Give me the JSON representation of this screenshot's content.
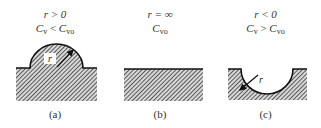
{
  "figure": {
    "panels": [
      {
        "id": "a",
        "condition": "r > 0",
        "relation": {
          "left_base": "C",
          "left_sub": "v",
          "op": " < ",
          "right_base": "C",
          "right_sub": "vo"
        },
        "caption": "(a)",
        "shape": "convex-bump",
        "radius_label": "r"
      },
      {
        "id": "b",
        "condition": "r = ∞",
        "relation": {
          "left_base": "C",
          "left_sub": "vo"
        },
        "caption": "(b)",
        "shape": "flat-surface"
      },
      {
        "id": "c",
        "condition": "r < 0",
        "relation": {
          "left_base": "C",
          "left_sub": "v",
          "op": " > ",
          "right_base": "C",
          "right_sub": "vo"
        },
        "caption": "(c)",
        "shape": "concave-depression",
        "radius_label": "r"
      }
    ]
  }
}
